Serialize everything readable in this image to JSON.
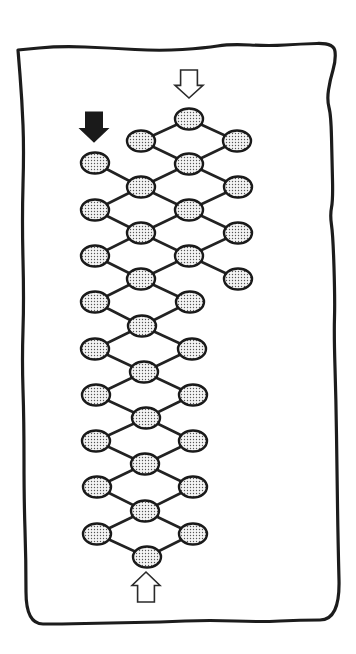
{
  "diagram": {
    "type": "lattice-ladder",
    "description": "Hand-drawn framed diagram of a diamond-shaped lattice of stippled oval nodes connected by thick lines, with entry arrows",
    "colors": {
      "background": "#ffffff",
      "ink": "#1a1a1a",
      "node_fill_base": "#f4f4f4",
      "node_dot": "#555555",
      "arrow_black": "#1a1a1a",
      "arrow_white": "#ffffff"
    },
    "frame": {
      "points": [
        [
          18,
          50
        ],
        [
          60,
          46
        ],
        [
          110,
          48
        ],
        [
          160,
          51
        ],
        [
          205,
          48
        ],
        [
          230,
          44
        ],
        [
          270,
          46
        ],
        [
          300,
          44
        ],
        [
          334,
          43
        ],
        [
          336,
          60
        ],
        [
          330,
          80
        ],
        [
          327,
          100
        ],
        [
          331,
          115
        ],
        [
          332,
          160
        ],
        [
          333,
          200
        ],
        [
          330,
          215
        ],
        [
          333,
          235
        ],
        [
          335,
          300
        ],
        [
          334,
          335
        ],
        [
          336,
          400
        ],
        [
          337,
          470
        ],
        [
          338,
          540
        ],
        [
          340,
          620
        ],
        [
          300,
          620
        ],
        [
          260,
          622
        ],
        [
          210,
          620
        ],
        [
          160,
          622
        ],
        [
          110,
          623
        ],
        [
          60,
          624
        ],
        [
          26,
          624
        ],
        [
          26,
          560
        ],
        [
          24,
          500
        ],
        [
          24,
          420
        ],
        [
          22,
          360
        ],
        [
          24,
          300
        ],
        [
          22,
          220
        ],
        [
          24,
          150
        ],
        [
          22,
          100
        ],
        [
          18,
          50
        ]
      ]
    },
    "arrows": [
      {
        "name": "top-entry-arrow",
        "style": "white",
        "direction": "down",
        "x": 189,
        "tip_y": 98,
        "base_y": 70,
        "width": 28
      },
      {
        "name": "left-entry-arrow",
        "style": "black",
        "direction": "down",
        "x": 94,
        "tip_y": 142,
        "base_y": 112,
        "width": 28
      },
      {
        "name": "bottom-entry-arrow",
        "style": "white",
        "direction": "up",
        "x": 146,
        "tip_y": 572,
        "base_y": 602,
        "width": 28
      }
    ],
    "node_size": {
      "rx": 14,
      "ry": 10.5
    },
    "nodes": [
      {
        "id": "A",
        "x": 189,
        "y": 119
      },
      {
        "id": "B",
        "x": 141,
        "y": 141
      },
      {
        "id": "C",
        "x": 237,
        "y": 141
      },
      {
        "id": "D",
        "x": 95,
        "y": 163
      },
      {
        "id": "E",
        "x": 189,
        "y": 164
      },
      {
        "id": "F",
        "x": 141,
        "y": 187
      },
      {
        "id": "G",
        "x": 238,
        "y": 187
      },
      {
        "id": "H",
        "x": 95,
        "y": 210
      },
      {
        "id": "I",
        "x": 189,
        "y": 210
      },
      {
        "id": "J",
        "x": 141,
        "y": 233
      },
      {
        "id": "K",
        "x": 238,
        "y": 233
      },
      {
        "id": "L",
        "x": 95,
        "y": 256
      },
      {
        "id": "M",
        "x": 189,
        "y": 256
      },
      {
        "id": "N",
        "x": 141,
        "y": 279
      },
      {
        "id": "O",
        "x": 238,
        "y": 279
      },
      {
        "id": "P",
        "x": 95,
        "y": 302
      },
      {
        "id": "Q",
        "x": 190,
        "y": 302
      },
      {
        "id": "R",
        "x": 142,
        "y": 326
      },
      {
        "id": "S",
        "x": 95,
        "y": 349
      },
      {
        "id": "T",
        "x": 192,
        "y": 349
      },
      {
        "id": "U",
        "x": 144,
        "y": 372
      },
      {
        "id": "V",
        "x": 96,
        "y": 395
      },
      {
        "id": "W",
        "x": 193,
        "y": 395
      },
      {
        "id": "X",
        "x": 146,
        "y": 418
      },
      {
        "id": "Y",
        "x": 96,
        "y": 441
      },
      {
        "id": "Z",
        "x": 193,
        "y": 441
      },
      {
        "id": "AA",
        "x": 145,
        "y": 464
      },
      {
        "id": "AB",
        "x": 97,
        "y": 487
      },
      {
        "id": "AC",
        "x": 193,
        "y": 487
      },
      {
        "id": "AD",
        "x": 145,
        "y": 511
      },
      {
        "id": "AE",
        "x": 97,
        "y": 534
      },
      {
        "id": "AF",
        "x": 193,
        "y": 534
      },
      {
        "id": "AG",
        "x": 147,
        "y": 557
      }
    ],
    "edges": [
      [
        "A",
        "B"
      ],
      [
        "A",
        "C"
      ],
      [
        "B",
        "E"
      ],
      [
        "C",
        "E"
      ],
      [
        "D",
        "F"
      ],
      [
        "E",
        "F"
      ],
      [
        "E",
        "G"
      ],
      [
        "F",
        "H"
      ],
      [
        "F",
        "I"
      ],
      [
        "G",
        "I"
      ],
      [
        "H",
        "J"
      ],
      [
        "I",
        "J"
      ],
      [
        "I",
        "K"
      ],
      [
        "J",
        "L"
      ],
      [
        "J",
        "M"
      ],
      [
        "K",
        "M"
      ],
      [
        "L",
        "N"
      ],
      [
        "M",
        "N"
      ],
      [
        "M",
        "O"
      ],
      [
        "N",
        "P"
      ],
      [
        "N",
        "Q"
      ],
      [
        "P",
        "R"
      ],
      [
        "Q",
        "R"
      ],
      [
        "R",
        "S"
      ],
      [
        "R",
        "T"
      ],
      [
        "S",
        "U"
      ],
      [
        "T",
        "U"
      ],
      [
        "U",
        "V"
      ],
      [
        "U",
        "W"
      ],
      [
        "V",
        "X"
      ],
      [
        "W",
        "X"
      ],
      [
        "X",
        "Y"
      ],
      [
        "X",
        "Z"
      ],
      [
        "Y",
        "AA"
      ],
      [
        "Z",
        "AA"
      ],
      [
        "AA",
        "AB"
      ],
      [
        "AA",
        "AC"
      ],
      [
        "AB",
        "AD"
      ],
      [
        "AC",
        "AD"
      ],
      [
        "AD",
        "AE"
      ],
      [
        "AD",
        "AF"
      ],
      [
        "AE",
        "AG"
      ],
      [
        "AF",
        "AG"
      ]
    ]
  }
}
